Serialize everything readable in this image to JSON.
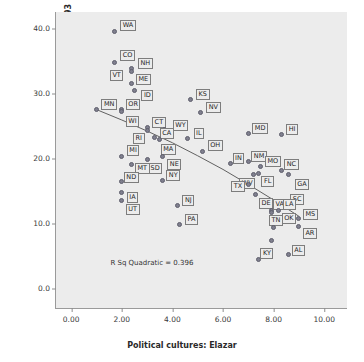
{
  "chart_data": {
    "type": "scatter",
    "title": "",
    "xlabel": "Political cultures: Elazar",
    "ylabel": "Women elected to state legislatures 1993",
    "xlim": [
      -0.6,
      10.9
    ],
    "ylim": [
      -3.0,
      42.5
    ],
    "xticks": [
      "0.00",
      "2.00",
      "4.00",
      "6.00",
      "8.00",
      "10.00"
    ],
    "xtick_values": [
      0,
      2,
      4,
      6,
      8,
      10
    ],
    "yticks": [
      "0.0",
      "10.0",
      "20.0",
      "30.0",
      "40.0"
    ],
    "ytick_values": [
      0,
      10,
      20,
      30,
      40
    ],
    "grid": false,
    "legend": false,
    "annotation": "R Sq Quadratic = 0.396",
    "annotation_x": 1.55,
    "annotation_y": 4.6,
    "fit": {
      "kind": "quadratic",
      "r_squared": 0.396,
      "x_start": 1.0,
      "x_end": 9.0,
      "points": [
        [
          1.0,
          27.5
        ],
        [
          2.0,
          25.9
        ],
        [
          3.0,
          24.2
        ],
        [
          4.0,
          22.4
        ],
        [
          5.0,
          20.4
        ],
        [
          6.0,
          18.3
        ],
        [
          7.0,
          16.0
        ],
        [
          8.0,
          13.6
        ],
        [
          9.0,
          11.1
        ]
      ]
    },
    "points": [
      {
        "label": "WA",
        "x": 1.7,
        "y": 39.5,
        "lx": 6,
        "ly": -12
      },
      {
        "label": "CO",
        "x": 1.7,
        "y": 34.8,
        "lx": 6,
        "ly": -12
      },
      {
        "label": "NH",
        "x": 2.4,
        "y": 33.8,
        "lx": 6,
        "ly": -11
      },
      {
        "label": "VT",
        "x": 2.4,
        "y": 33.3,
        "lx": -22,
        "ly": -2
      },
      {
        "label": "ME",
        "x": 2.4,
        "y": 31.5,
        "lx": 4,
        "ly": -10
      },
      {
        "label": "ID",
        "x": 2.5,
        "y": 30.4,
        "lx": 7,
        "ly": -1
      },
      {
        "label": "KS",
        "x": 4.7,
        "y": 29.0,
        "lx": 6,
        "ly": -11
      },
      {
        "label": "MN",
        "x": 1.0,
        "y": 27.5,
        "lx": 5,
        "ly": -11
      },
      {
        "label": "OR",
        "x": 2.0,
        "y": 27.5,
        "lx": 4,
        "ly": -11
      },
      {
        "label": "WI",
        "x": 2.0,
        "y": 27.2,
        "lx": 4,
        "ly": 4
      },
      {
        "label": "NV",
        "x": 5.1,
        "y": 27.0,
        "lx": 6,
        "ly": -11
      },
      {
        "label": "CT",
        "x": 3.0,
        "y": 24.7,
        "lx": 5,
        "ly": -11
      },
      {
        "label": "RI",
        "x": 3.0,
        "y": 24.3,
        "lx": -14,
        "ly": 3
      },
      {
        "label": "WY",
        "x": 3.7,
        "y": 24.4,
        "lx": 8,
        "ly": -10
      },
      {
        "label": "MD",
        "x": 7.0,
        "y": 23.8,
        "lx": 4,
        "ly": -11
      },
      {
        "label": "HI",
        "x": 8.3,
        "y": 23.6,
        "lx": 5,
        "ly": -11
      },
      {
        "label": "CA",
        "x": 3.3,
        "y": 23.2,
        "lx": 5,
        "ly": -10
      },
      {
        "label": "IL",
        "x": 4.6,
        "y": 23.1,
        "lx": 6,
        "ly": -10
      },
      {
        "label": "MA",
        "x": 3.5,
        "y": 22.9,
        "lx": 1,
        "ly": 4
      },
      {
        "label": "OH",
        "x": 5.2,
        "y": 21.1,
        "lx": 5,
        "ly": -11
      },
      {
        "label": "MI",
        "x": 2.0,
        "y": 20.3,
        "lx": 5,
        "ly": -11
      },
      {
        "label": "SD",
        "x": 3.0,
        "y": 19.9,
        "lx": 1,
        "ly": 4
      },
      {
        "label": "NE",
        "x": 3.6,
        "y": 20.3,
        "lx": 5,
        "ly": 3
      },
      {
        "label": "IN",
        "x": 6.3,
        "y": 19.2,
        "lx": 2,
        "ly": -11
      },
      {
        "label": "NM",
        "x": 7.0,
        "y": 19.5,
        "lx": 3,
        "ly": -11
      },
      {
        "label": "MT",
        "x": 2.4,
        "y": 19.0,
        "lx": 3,
        "ly": -2
      },
      {
        "label": "MO",
        "x": 7.5,
        "y": 18.8,
        "lx": 4,
        "ly": -10
      },
      {
        "label": "NC",
        "x": 8.3,
        "y": 18.2,
        "lx": 3,
        "ly": -11
      },
      {
        "label": "WV",
        "x": 7.2,
        "y": 17.5,
        "lx": -14,
        "ly": 3
      },
      {
        "label": "FL",
        "x": 7.4,
        "y": 17.7,
        "lx": 3,
        "ly": 3
      },
      {
        "label": "GA",
        "x": 8.6,
        "y": 17.5,
        "lx": 6,
        "ly": 4
      },
      {
        "label": "NY",
        "x": 3.6,
        "y": 16.6,
        "lx": 4,
        "ly": -10
      },
      {
        "label": "ND",
        "x": 2.0,
        "y": 16.4,
        "lx": 2,
        "ly": -10
      },
      {
        "label": "TX",
        "x": 7.0,
        "y": 16.0,
        "lx": -17,
        "ly": -3
      },
      {
        "label": "IA",
        "x": 2.0,
        "y": 14.8,
        "lx": 5,
        "ly": 0
      },
      {
        "label": "DE",
        "x": 7.3,
        "y": 14.5,
        "lx": 3,
        "ly": 4
      },
      {
        "label": "UT",
        "x": 2.0,
        "y": 13.6,
        "lx": 4,
        "ly": 4
      },
      {
        "label": "SC",
        "x": 8.5,
        "y": 12.9,
        "lx": 4,
        "ly": -11
      },
      {
        "label": "NJ",
        "x": 4.2,
        "y": 12.8,
        "lx": 5,
        "ly": -10
      },
      {
        "label": "VA",
        "x": 7.9,
        "y": 12.0,
        "lx": 2,
        "ly": -11
      },
      {
        "label": "TN",
        "x": 7.9,
        "y": 11.7,
        "lx": -2,
        "ly": 3
      },
      {
        "label": "OK",
        "x": 8.2,
        "y": 12.0,
        "lx": 3,
        "ly": 3
      },
      {
        "label": "MS",
        "x": 9.0,
        "y": 10.8,
        "lx": 4,
        "ly": -9
      },
      {
        "label": "PA",
        "x": 4.3,
        "y": 9.9,
        "lx": 5,
        "ly": -10
      },
      {
        "label": "AR",
        "x": 9.0,
        "y": 9.6,
        "lx": 4,
        "ly": 2
      },
      {
        "label": "LA",
        "x": 8.0,
        "y": 9.4,
        "lx": 9,
        "ly": -28
      },
      {
        "label": "AL",
        "x": 8.6,
        "y": 5.2,
        "lx": 3,
        "ly": -10
      },
      {
        "label": "KY",
        "x": 7.4,
        "y": 4.5,
        "lx": 2,
        "ly": -11
      },
      {
        "label": "WV2",
        "x": 7.9,
        "y": 7.4,
        "lx": -99,
        "ly": -99
      }
    ]
  }
}
